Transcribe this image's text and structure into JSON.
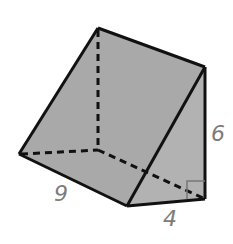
{
  "figure": {
    "type": "triangular-prism",
    "fill_color": "#a9a9a9",
    "edge_color": "#111111",
    "label_color": "#7b7b7b",
    "vertices": {
      "top_back": [
        98,
        28
      ],
      "top_front": [
        205,
        67
      ],
      "bottom_left": [
        19,
        154
      ],
      "hidden_back": [
        98,
        150
      ],
      "front_left": [
        127,
        206
      ],
      "front_right": [
        205,
        199
      ]
    },
    "labels": {
      "length": "9",
      "width": "4",
      "height": "6"
    },
    "right_angle_marker": true
  }
}
